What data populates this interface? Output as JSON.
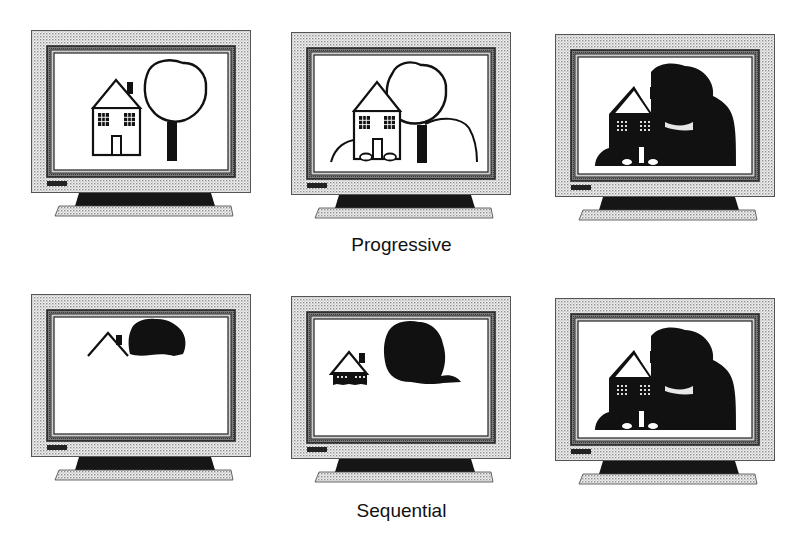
{
  "figure": {
    "rows": [
      {
        "label": "Progressive",
        "panels": [
          {
            "stage": 1,
            "description": "House and tree outline drawn"
          },
          {
            "stage": 2,
            "description": "Outline with hills added"
          },
          {
            "stage": 3,
            "description": "Filled silhouette complete"
          }
        ]
      },
      {
        "label": "Sequential",
        "panels": [
          {
            "stage": 1,
            "description": "Roof line and top of tree filled"
          },
          {
            "stage": 2,
            "description": "Upper half filled"
          },
          {
            "stage": 3,
            "description": "Full image filled"
          }
        ]
      }
    ],
    "colors": {
      "ink": "#111111",
      "bezel_dots": "#9a9a9a",
      "screen": "#ffffff"
    }
  }
}
